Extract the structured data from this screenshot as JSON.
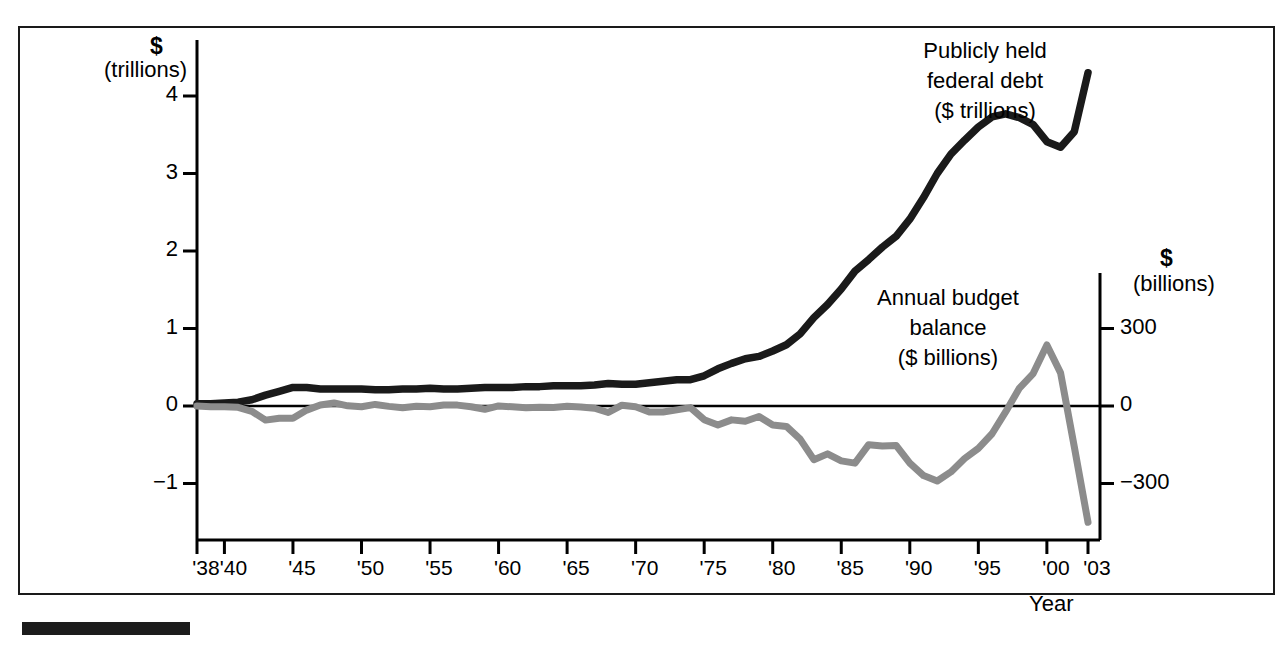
{
  "figure": {
    "left_axis": {
      "unit_symbol": "$",
      "unit_name": "(trillions)",
      "ticks": [
        {
          "label": "4",
          "value": 4
        },
        {
          "label": "3",
          "value": 3
        },
        {
          "label": "2",
          "value": 2
        },
        {
          "label": "1",
          "value": 1
        },
        {
          "label": "0",
          "value": 0
        },
        {
          "label": "−1",
          "value": -1
        }
      ]
    },
    "right_axis": {
      "unit_symbol": "$",
      "unit_name": "(billions)",
      "ticks": [
        {
          "label": "300",
          "value": 300
        },
        {
          "label": "0",
          "value": 0
        },
        {
          "label": "−300",
          "value": -300
        }
      ]
    },
    "x_axis": {
      "title": "Year",
      "ticks": [
        {
          "label": "'38",
          "year": 1938
        },
        {
          "label": "'40",
          "year": 1940
        },
        {
          "label": "'45",
          "year": 1945
        },
        {
          "label": "'50",
          "year": 1950
        },
        {
          "label": "'55",
          "year": 1955
        },
        {
          "label": "'60",
          "year": 1960
        },
        {
          "label": "'65",
          "year": 1965
        },
        {
          "label": "'70",
          "year": 1970
        },
        {
          "label": "'75",
          "year": 1975
        },
        {
          "label": "'80",
          "year": 1980
        },
        {
          "label": "'85",
          "year": 1985
        },
        {
          "label": "'90",
          "year": 1990
        },
        {
          "label": "'95",
          "year": 1995
        },
        {
          "label": "'00",
          "year": 2000
        },
        {
          "label": "'03",
          "year": 2003
        }
      ]
    },
    "annotations": [
      {
        "id": "debt-annotation",
        "lines": [
          "Publicly held",
          "federal debt",
          "($ trillions)"
        ]
      },
      {
        "id": "balance-annotation",
        "lines": [
          "Annual budget",
          "balance",
          "($ billions)"
        ]
      }
    ],
    "colors": {
      "debt_line": "#1a1a1a",
      "balance_line": "#8c8c8c",
      "frame": "#1a1a1a",
      "zero_line": "#000000",
      "background": "#ffffff"
    }
  },
  "chart_data": {
    "type": "line",
    "title": "",
    "xlabel": "Year",
    "ylabel": "$ (trillions)",
    "y2label": "$ (billions)",
    "grid": false,
    "legend": "annotations-inline",
    "xlim": [
      1938,
      2003
    ],
    "ylim": [
      -1.6,
      4.6
    ],
    "y2lim": [
      -480,
      1380
    ],
    "x": [
      1938,
      1939,
      1940,
      1941,
      1942,
      1943,
      1944,
      1945,
      1946,
      1947,
      1948,
      1949,
      1950,
      1951,
      1952,
      1953,
      1954,
      1955,
      1956,
      1957,
      1958,
      1959,
      1960,
      1961,
      1962,
      1963,
      1964,
      1965,
      1966,
      1967,
      1968,
      1969,
      1970,
      1971,
      1972,
      1973,
      1974,
      1975,
      1976,
      1977,
      1978,
      1979,
      1980,
      1981,
      1982,
      1983,
      1984,
      1985,
      1986,
      1987,
      1988,
      1989,
      1990,
      1991,
      1992,
      1993,
      1994,
      1995,
      1996,
      1997,
      1998,
      1999,
      2000,
      2001,
      2002,
      2003
    ],
    "series": [
      {
        "name": "Publicly held federal debt ($ trillions)",
        "axis": "left",
        "unit": "trillions of dollars",
        "color": "#1a1a1a",
        "values": [
          0.03,
          0.03,
          0.04,
          0.05,
          0.08,
          0.14,
          0.19,
          0.24,
          0.24,
          0.22,
          0.22,
          0.22,
          0.22,
          0.21,
          0.21,
          0.22,
          0.22,
          0.23,
          0.22,
          0.22,
          0.23,
          0.24,
          0.24,
          0.24,
          0.25,
          0.25,
          0.26,
          0.26,
          0.26,
          0.27,
          0.29,
          0.28,
          0.28,
          0.3,
          0.32,
          0.34,
          0.34,
          0.39,
          0.48,
          0.55,
          0.61,
          0.64,
          0.71,
          0.79,
          0.93,
          1.14,
          1.31,
          1.51,
          1.74,
          1.89,
          2.05,
          2.19,
          2.41,
          2.69,
          3.0,
          3.25,
          3.43,
          3.6,
          3.73,
          3.77,
          3.72,
          3.63,
          3.41,
          3.34,
          3.54,
          4.3
        ]
      },
      {
        "name": "Annual budget balance ($ billions)",
        "axis": "right",
        "unit": "billions of dollars",
        "color": "#8c8c8c",
        "values": [
          -0.1,
          -2.9,
          -2.9,
          -4.9,
          -20.5,
          -54.6,
          -47.6,
          -47.6,
          -15.9,
          4.0,
          11.8,
          0.6,
          -3.1,
          6.1,
          -1.5,
          -6.5,
          -1.2,
          -3.0,
          3.9,
          3.4,
          -2.8,
          -12.8,
          0.3,
          -3.3,
          -7.1,
          -4.8,
          -5.9,
          -1.4,
          -3.7,
          -8.6,
          -25.2,
          3.2,
          -2.8,
          -23.0,
          -23.4,
          -14.9,
          -6.1,
          -53.2,
          -73.7,
          -53.7,
          -59.2,
          -40.7,
          -73.8,
          -79.0,
          -128.0,
          -207.8,
          -185.4,
          -212.3,
          -221.2,
          -149.7,
          -155.2,
          -152.6,
          -221.0,
          -269.2,
          -290.3,
          -255.1,
          -203.2,
          -164.0,
          -107.4,
          -21.9,
          69.3,
          125.6,
          236.2,
          128.2,
          -157.8,
          -450.0
        ]
      }
    ]
  }
}
